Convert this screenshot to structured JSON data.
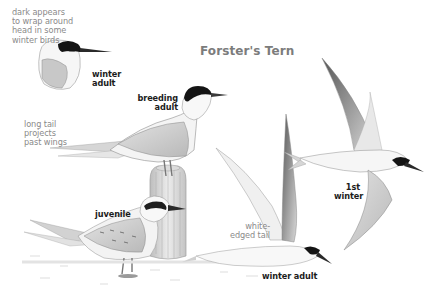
{
  "title": "Forster's Tern",
  "corner_text": "",
  "labels": {
    "head_note": "dark appears\nto wrap around\nhead in some\nwinter birds",
    "winter_adult_head": "winter\nadult",
    "breeding_adult": "breeding\nadult",
    "tail_note": "long tail\nprojects\npast wings",
    "juvenile": "juvenile",
    "white_edged_tail": "white-\nedged tail",
    "first_winter": "1st\nwinter",
    "winter_adult_flying": "winter adult"
  },
  "colors": {
    "background": "#ffffff",
    "note_text": "#8a8a8a",
    "plumage_label": "#1c1c1c",
    "title": "#7c7c7c",
    "cap_black": "#141414",
    "wing_grey": "#c9c9c9",
    "bill_dark": "#2a2a2a",
    "post_grey": "#d8d8d8"
  }
}
